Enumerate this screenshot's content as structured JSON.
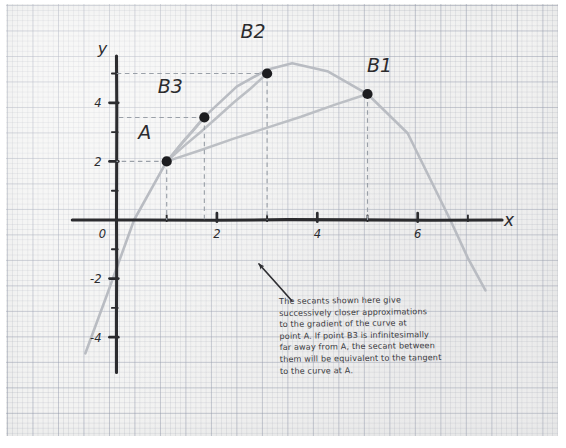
{
  "figure": {
    "title_text": "Secants approaching a tangent",
    "axis_labels": {
      "x": "x",
      "y": "y"
    },
    "note": "The secants shown here give\nsuccessively closer approximations\nto the gradient of the curve at\npoint A. If point B3 is infinitesimally\nfar away from A, the secant between\nthem will be equivalent to the tangent\nto the curve at A.",
    "colors": {
      "paper": "#f3f3f2",
      "grid_fine": "#969baa",
      "grid_bold": "#8c94a8",
      "ink": "#2b2b2e",
      "curve": "#b9bcc2",
      "secant": "#bcbfc4",
      "guide": "#9aa0a8",
      "point": "#1d1d20"
    }
  },
  "chart_data": {
    "type": "line",
    "title": "",
    "xlabel": "x",
    "ylabel": "y",
    "xlim": [
      -1.0,
      7.8
    ],
    "ylim": [
      -5.0,
      5.8
    ],
    "grid": true,
    "legend": "none",
    "x_ticks": [
      0,
      1,
      2,
      3,
      4,
      5,
      6,
      7
    ],
    "x_tick_labels": [
      "0",
      "",
      "2",
      "",
      "4",
      "",
      "6",
      ""
    ],
    "y_ticks": [
      -4,
      -3,
      -2,
      -1,
      0,
      1,
      2,
      3,
      4,
      5
    ],
    "y_tick_labels": [
      "-4",
      "",
      "-2",
      "",
      "0",
      "",
      "2",
      "",
      "4",
      ""
    ],
    "curve": {
      "name": "parabola",
      "description": "downward parabola through A, B3, B2, B1",
      "vertex": [
        3.5,
        5.35
      ],
      "x_intercepts": [
        0.35,
        6.65
      ],
      "x_range": [
        -0.62,
        7.35
      ],
      "points_x": [
        -0.62,
        -0.2,
        0.35,
        1.0,
        1.75,
        2.4,
        3.0,
        3.5,
        4.2,
        5.0,
        5.8,
        6.65,
        7.0,
        7.35
      ],
      "points_y": [
        -4.55,
        -2.6,
        0.0,
        2.0,
        3.52,
        4.56,
        5.13,
        5.35,
        5.08,
        4.3,
        2.96,
        0.0,
        -1.3,
        -2.4
      ]
    },
    "points": [
      {
        "label": "A",
        "x": 1.0,
        "y": 2.0,
        "label_dx": -22,
        "label_dy": -22
      },
      {
        "label": "B3",
        "x": 1.75,
        "y": 3.5,
        "label_dx": -34,
        "label_dy": -24
      },
      {
        "label": "B2",
        "x": 3.0,
        "y": 5.0,
        "label_dx": -14,
        "label_dy": -36
      },
      {
        "label": "B1",
        "x": 5.0,
        "y": 4.3,
        "label_dx": 12,
        "label_dy": -22
      }
    ],
    "secants": [
      {
        "name": "secant-A-B1",
        "from": "A",
        "to": "B1"
      },
      {
        "name": "secant-A-B2",
        "from": "A",
        "to": "B2"
      },
      {
        "name": "secant-A-B3",
        "from": "A",
        "to": "B3"
      }
    ],
    "guide_lines": [
      {
        "for": "A",
        "to_axis": "both"
      },
      {
        "for": "B3",
        "to_axis": "both"
      },
      {
        "for": "B2",
        "to_axis": "both"
      },
      {
        "for": "B1",
        "to_axis": "x"
      }
    ],
    "annotation_arrow": {
      "from": [
        292,
        301
      ],
      "to": [
        259,
        264
      ]
    }
  }
}
